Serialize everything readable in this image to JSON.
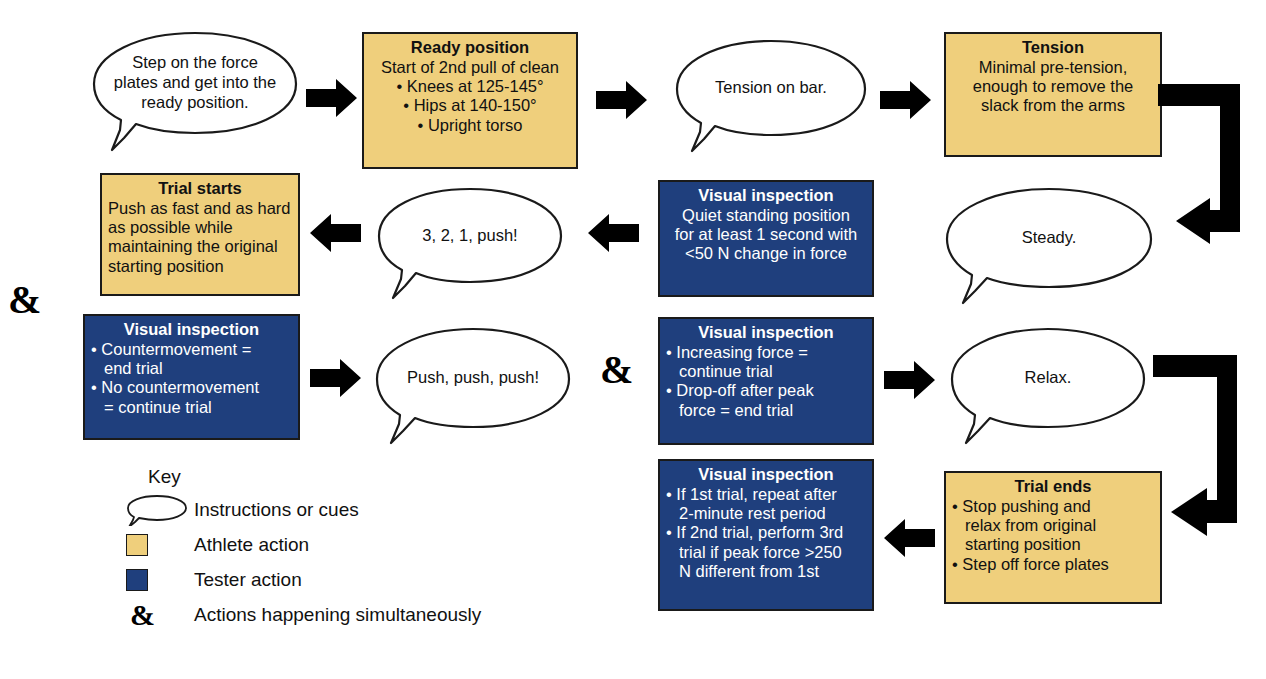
{
  "figure": {
    "type": "flowchart"
  },
  "colors": {
    "athlete_action": "#efcf7c",
    "tester_action": "#1f3f7d",
    "outline": "#1a1a1a",
    "arrow": "#000000",
    "background": "#ffffff"
  },
  "nodes": {
    "step_ready_cue": {
      "kind": "bubble",
      "lines": [
        "Step on the force",
        "plates and get into the",
        "ready position."
      ]
    },
    "ready_position": {
      "kind": "athlete",
      "title": "Ready position",
      "lines": [
        "Start of 2nd pull of clean"
      ],
      "bullets": [
        "• Knees at 125-145°",
        "• Hips at 140-150°",
        "• Upright torso"
      ]
    },
    "tension_on_bar": {
      "kind": "bubble",
      "lines": [
        "Tension on bar."
      ]
    },
    "tension": {
      "kind": "athlete",
      "title": "Tension",
      "lines": [
        "Minimal pre-tension,",
        "enough to remove the",
        "slack from the arms"
      ]
    },
    "steady": {
      "kind": "bubble",
      "lines": [
        "Steady."
      ]
    },
    "visual_inspection_quiet": {
      "kind": "tester",
      "title": "Visual inspection",
      "lines": [
        "Quiet standing position",
        "for at least 1 second with",
        "<50 N change in force"
      ]
    },
    "countdown": {
      "kind": "bubble",
      "lines": [
        "3, 2, 1, push!"
      ]
    },
    "trial_starts": {
      "kind": "athlete",
      "title": "Trial starts",
      "lines": [
        "Push as fast and as hard",
        "as possible while",
        "maintaining the original",
        "starting position"
      ]
    },
    "visual_inspection_counter": {
      "kind": "tester",
      "title": "Visual inspection",
      "bullets": [
        {
          "text": "• Countermovement =",
          "cont": "end trial"
        },
        {
          "text": "• No countermovement",
          "cont": "= continue trial"
        }
      ]
    },
    "push_push_push": {
      "kind": "bubble",
      "lines": [
        "Push, push, push!"
      ]
    },
    "visual_inspection_force": {
      "kind": "tester",
      "title": "Visual inspection",
      "bullets": [
        {
          "text": "• Increasing force =",
          "cont": "continue trial"
        },
        {
          "text": "• Drop-off after peak",
          "cont": "force = end trial"
        }
      ]
    },
    "relax": {
      "kind": "bubble",
      "lines": [
        "Relax."
      ]
    },
    "trial_ends": {
      "kind": "athlete",
      "title": "Trial ends",
      "bullets": [
        {
          "text": "• Stop pushing and",
          "cont": "relax from original\nstarting position"
        },
        {
          "text": "• Step off force plates",
          "cont": ""
        }
      ]
    },
    "visual_inspection_repeat": {
      "kind": "tester",
      "title": "Visual inspection",
      "bullets": [
        {
          "text": "• If 1st trial, repeat after",
          "cont": "2-minute rest period"
        },
        {
          "text": "• If 2nd trial, perform 3rd",
          "cont": "trial if peak force >250\nN different from 1st"
        }
      ]
    }
  },
  "simultaneous_markers": [
    {
      "name": "amp-left",
      "symbol": "&"
    },
    {
      "name": "amp-middle",
      "symbol": "&"
    }
  ],
  "key": {
    "title": "Key",
    "items": [
      {
        "glyph": "speech-bubble",
        "label": "Instructions or cues"
      },
      {
        "glyph": "yellow-swatch",
        "label": "Athlete action"
      },
      {
        "glyph": "blue-swatch",
        "label": "Tester action"
      },
      {
        "glyph": "ampersand",
        "symbol": "&",
        "label": "Actions happening simultaneously"
      }
    ]
  }
}
